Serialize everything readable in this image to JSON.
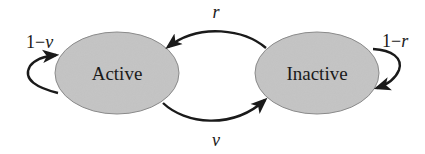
{
  "diagram": {
    "type": "state-transition",
    "colors": {
      "node_fill": "#c4c4c4",
      "node_stroke": "#8a8a8a",
      "edge": "#1a1a1a",
      "text": "#1a1a1a",
      "background": "#ffffff"
    },
    "nodes": [
      {
        "id": "active",
        "label": "Active"
      },
      {
        "id": "inactive",
        "label": "Inactive"
      }
    ],
    "edges": [
      {
        "from": "active",
        "to": "active",
        "label_prefix": "1−",
        "label_var": "ν"
      },
      {
        "from": "inactive",
        "to": "active",
        "label_var": "r"
      },
      {
        "from": "active",
        "to": "inactive",
        "label_var": "ν"
      },
      {
        "from": "inactive",
        "to": "inactive",
        "label_prefix": "1−",
        "label_var": "r"
      }
    ]
  }
}
